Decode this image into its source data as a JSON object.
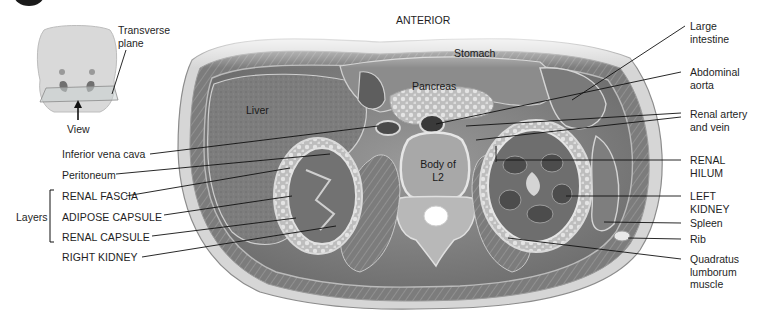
{
  "figure": {
    "orientation_label": "ANTERIOR",
    "inset": {
      "plane_label_line1": "Transverse",
      "plane_label_line2": "plane",
      "view_label": "View"
    },
    "inner_labels": {
      "stomach": "Stomach",
      "pancreas": "Pancreas",
      "liver": "Liver",
      "vertebra_line1": "Body of",
      "vertebra_line2": "L2"
    },
    "left_labels": [
      {
        "id": "ivc",
        "text": "Inferior vena cava"
      },
      {
        "id": "peritoneum",
        "text": "Peritoneum"
      },
      {
        "id": "renal-fascia",
        "text": "RENAL FASCIA"
      },
      {
        "id": "adipose-capsule",
        "text": "ADIPOSE CAPSULE"
      },
      {
        "id": "renal-capsule",
        "text": "RENAL CAPSULE"
      },
      {
        "id": "right-kidney",
        "text": "RIGHT KIDNEY"
      }
    ],
    "layers_bracket_label": "Layers",
    "right_labels": [
      {
        "id": "large-intestine",
        "line1": "Large",
        "line2": "intestine"
      },
      {
        "id": "abdominal-aorta",
        "line1": "Abdominal",
        "line2": "aorta"
      },
      {
        "id": "renal-artery-vein",
        "line1": "Renal artery",
        "line2": "and vein"
      },
      {
        "id": "renal-hilum",
        "line1": "RENAL",
        "line2": "HILUM"
      },
      {
        "id": "left-kidney",
        "line1": "LEFT",
        "line2": "KIDNEY"
      },
      {
        "id": "spleen",
        "line1": "Spleen"
      },
      {
        "id": "rib",
        "line1": "Rib"
      },
      {
        "id": "quadratus",
        "line1": "Quadratus",
        "line2": "lumborum",
        "line3": "muscle"
      }
    ],
    "colors": {
      "background": "#ffffff",
      "tissue_dark": "#5f5f5f",
      "tissue_mid": "#8a8a8a",
      "tissue_light": "#c8c8c8",
      "leader_line": "#111111"
    }
  }
}
